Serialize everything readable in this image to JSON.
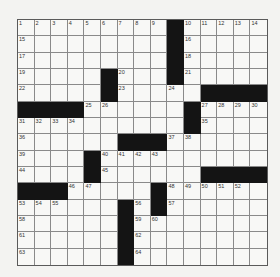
{
  "puzzle": {
    "rows": 15,
    "cols": 15,
    "layout": [
      "000000000#00000",
      "000000000#00000",
      "000000000#00000",
      "00000#000#00000",
      "00000#00000####",
      "####000000#0000",
      "0000000000#0000",
      "000000###000000",
      "0000#0000000000",
      "0000#000000####",
      "###00000#000000",
      "000000#0#000000",
      "000000#00000000",
      "000000#00000000",
      "000000#00000000"
    ],
    "numbers": [
      {
        "r": 0,
        "c": 0,
        "n": "1"
      },
      {
        "r": 0,
        "c": 1,
        "n": "2"
      },
      {
        "r": 0,
        "c": 2,
        "n": "3"
      },
      {
        "r": 0,
        "c": 3,
        "n": "4"
      },
      {
        "r": 0,
        "c": 4,
        "n": "5"
      },
      {
        "r": 0,
        "c": 5,
        "n": "6"
      },
      {
        "r": 0,
        "c": 6,
        "n": "7"
      },
      {
        "r": 0,
        "c": 7,
        "n": "8"
      },
      {
        "r": 0,
        "c": 8,
        "n": "9"
      },
      {
        "r": 0,
        "c": 10,
        "n": "10"
      },
      {
        "r": 0,
        "c": 11,
        "n": "11"
      },
      {
        "r": 0,
        "c": 12,
        "n": "12"
      },
      {
        "r": 0,
        "c": 13,
        "n": "13"
      },
      {
        "r": 0,
        "c": 14,
        "n": "14"
      },
      {
        "r": 1,
        "c": 0,
        "n": "15"
      },
      {
        "r": 1,
        "c": 10,
        "n": "16"
      },
      {
        "r": 2,
        "c": 0,
        "n": "17"
      },
      {
        "r": 2,
        "c": 10,
        "n": "18"
      },
      {
        "r": 3,
        "c": 0,
        "n": "19"
      },
      {
        "r": 3,
        "c": 6,
        "n": "20"
      },
      {
        "r": 3,
        "c": 10,
        "n": "21"
      },
      {
        "r": 4,
        "c": 0,
        "n": "22"
      },
      {
        "r": 4,
        "c": 6,
        "n": "23"
      },
      {
        "r": 4,
        "c": 9,
        "n": "24"
      },
      {
        "r": 5,
        "c": 4,
        "n": "25"
      },
      {
        "r": 5,
        "c": 5,
        "n": "26"
      },
      {
        "r": 5,
        "c": 11,
        "n": "27"
      },
      {
        "r": 5,
        "c": 12,
        "n": "28"
      },
      {
        "r": 5,
        "c": 13,
        "n": "29"
      },
      {
        "r": 5,
        "c": 14,
        "n": "30"
      },
      {
        "r": 6,
        "c": 0,
        "n": "31"
      },
      {
        "r": 6,
        "c": 1,
        "n": "32"
      },
      {
        "r": 6,
        "c": 2,
        "n": "33"
      },
      {
        "r": 6,
        "c": 3,
        "n": "34"
      },
      {
        "r": 6,
        "c": 11,
        "n": "35"
      },
      {
        "r": 7,
        "c": 0,
        "n": "36"
      },
      {
        "r": 7,
        "c": 9,
        "n": "37"
      },
      {
        "r": 7,
        "c": 10,
        "n": "38"
      },
      {
        "r": 8,
        "c": 0,
        "n": "39"
      },
      {
        "r": 8,
        "c": 5,
        "n": "40"
      },
      {
        "r": 8,
        "c": 6,
        "n": "41"
      },
      {
        "r": 8,
        "c": 7,
        "n": "42"
      },
      {
        "r": 8,
        "c": 8,
        "n": "43"
      },
      {
        "r": 9,
        "c": 0,
        "n": "44"
      },
      {
        "r": 9,
        "c": 5,
        "n": "45"
      },
      {
        "r": 10,
        "c": 3,
        "n": "46"
      },
      {
        "r": 10,
        "c": 4,
        "n": "47"
      },
      {
        "r": 10,
        "c": 9,
        "n": "48"
      },
      {
        "r": 10,
        "c": 10,
        "n": "49"
      },
      {
        "r": 10,
        "c": 11,
        "n": "50"
      },
      {
        "r": 10,
        "c": 12,
        "n": "51"
      },
      {
        "r": 10,
        "c": 13,
        "n": "52"
      },
      {
        "r": 11,
        "c": 0,
        "n": "53"
      },
      {
        "r": 11,
        "c": 1,
        "n": "54"
      },
      {
        "r": 11,
        "c": 2,
        "n": "55"
      },
      {
        "r": 11,
        "c": 7,
        "n": "56"
      },
      {
        "r": 11,
        "c": 9,
        "n": "57"
      },
      {
        "r": 12,
        "c": 0,
        "n": "58"
      },
      {
        "r": 12,
        "c": 7,
        "n": "59"
      },
      {
        "r": 12,
        "c": 8,
        "n": "60"
      },
      {
        "r": 13,
        "c": 0,
        "n": "61"
      },
      {
        "r": 13,
        "c": 7,
        "n": "62"
      },
      {
        "r": 14,
        "c": 0,
        "n": "63"
      },
      {
        "r": 14,
        "c": 7,
        "n": "64"
      }
    ]
  },
  "colors": {
    "black_square": "#141414",
    "cell_bg": "#f8f8f6",
    "grid_line": "#8a8a8a",
    "page_bg": "#f3f3f1"
  }
}
